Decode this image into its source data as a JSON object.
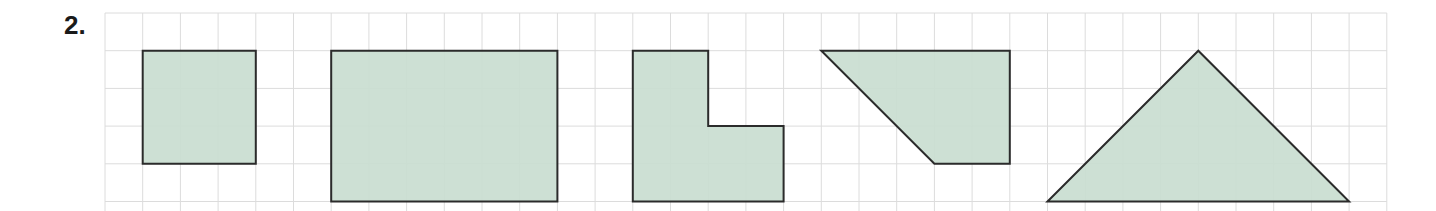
{
  "exercise": {
    "number_label": "2."
  },
  "grid": {
    "origin_x": 105,
    "origin_y": 13,
    "cell": 37.7,
    "cols": 34,
    "rows": 6,
    "line_color": "#dcdcdc"
  },
  "colors": {
    "fill": "#c9ddd0",
    "stroke": "#2b2b2b"
  },
  "shapes": [
    {
      "id": "square",
      "name": "square",
      "points": [
        [
          1,
          1
        ],
        [
          4,
          1
        ],
        [
          4,
          4
        ],
        [
          1,
          4
        ]
      ]
    },
    {
      "id": "rectangle",
      "name": "rectangle",
      "points": [
        [
          6,
          1
        ],
        [
          12,
          1
        ],
        [
          12,
          5
        ],
        [
          6,
          5
        ]
      ]
    },
    {
      "id": "l-shape",
      "name": "L-shape",
      "points": [
        [
          14,
          1
        ],
        [
          16,
          1
        ],
        [
          16,
          3
        ],
        [
          18,
          3
        ],
        [
          18,
          5
        ],
        [
          14,
          5
        ]
      ]
    },
    {
      "id": "trapezoid",
      "name": "trapezoid",
      "points": [
        [
          19,
          1
        ],
        [
          24,
          1
        ],
        [
          24,
          4
        ],
        [
          22,
          4
        ]
      ]
    },
    {
      "id": "triangle",
      "name": "triangle",
      "points": [
        [
          25,
          5
        ],
        [
          29,
          1
        ],
        [
          33,
          5
        ]
      ]
    }
  ]
}
